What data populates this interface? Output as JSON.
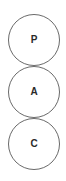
{
  "diagram": {
    "type": "stacked-circles",
    "nodes": [
      {
        "label": "P"
      },
      {
        "label": "A"
      },
      {
        "label": "C"
      }
    ],
    "colors": {
      "stroke": "#6a6a6a",
      "text": "#2a2a2a",
      "background": "#ffffff"
    }
  }
}
